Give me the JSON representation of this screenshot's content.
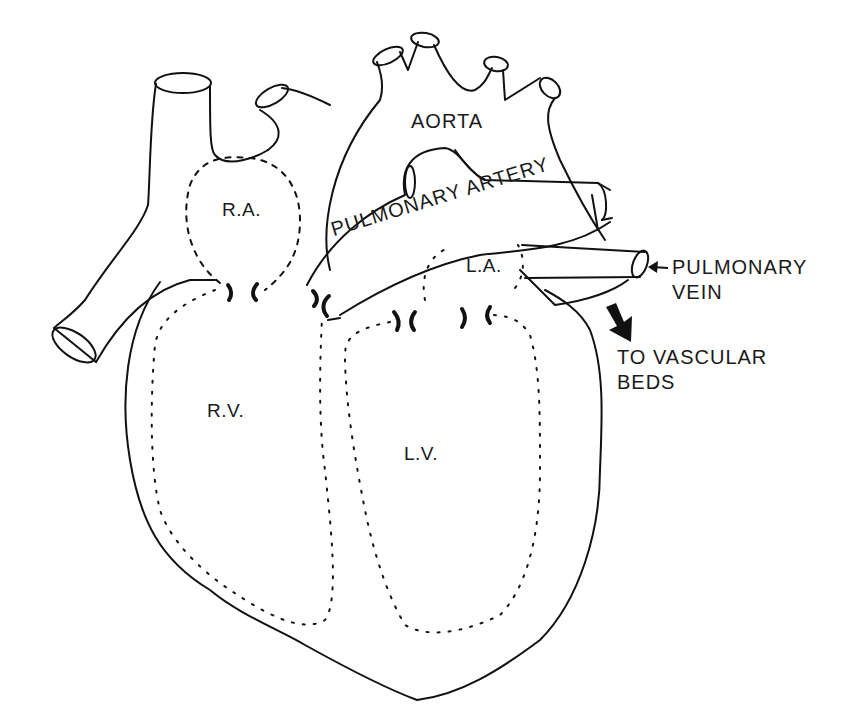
{
  "diagram": {
    "type": "anatomical line drawing",
    "labels": {
      "aorta": "AORTA",
      "pulmonary_artery": "PULMONARY ARTERY",
      "right_atrium": "R.A.",
      "left_atrium": "L.A.",
      "right_ventricle": "R.V.",
      "left_ventricle": "L.V.",
      "pulmonary_vein_line1": "PULMONARY",
      "pulmonary_vein_line2": "VEIN",
      "vascular_beds_line1": "TO VASCULAR",
      "vascular_beds_line2": "BEDS"
    },
    "arrows": [
      {
        "name": "pulmonary-vein-pointer",
        "direction": "left",
        "style": "thin"
      },
      {
        "name": "to-vascular-beds-arrow",
        "direction": "down-right",
        "style": "bold filled"
      }
    ],
    "colors": {
      "line": "#111111",
      "background": "#ffffff"
    }
  }
}
